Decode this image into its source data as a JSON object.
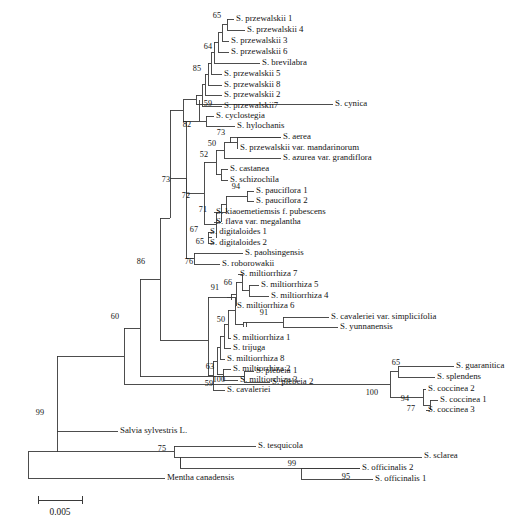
{
  "figure": {
    "scale_bar": {
      "label": "0.005",
      "x1": 38,
      "x2": 82,
      "y": 502
    }
  },
  "chart_data": {
    "type": "tree",
    "scale_label": "0.005",
    "tips": [
      {
        "id": "t1",
        "label": "S. przewalskii 1",
        "x": 236,
        "y": 19
      },
      {
        "id": "t2",
        "label": "S. przewalskii 4",
        "x": 247,
        "y": 30
      },
      {
        "id": "t3",
        "label": "S. przewalskii 3",
        "x": 231,
        "y": 41
      },
      {
        "id": "t4",
        "label": "S. przewalskii 6",
        "x": 231,
        "y": 52
      },
      {
        "id": "t5",
        "label": "S. brevilabra",
        "x": 262,
        "y": 63
      },
      {
        "id": "t6",
        "label": "S. przewalskii 5",
        "x": 224,
        "y": 74
      },
      {
        "id": "t7",
        "label": "S. przewalskii 8",
        "x": 224,
        "y": 85
      },
      {
        "id": "t8",
        "label": "S. przewalskii 2",
        "x": 224,
        "y": 95
      },
      {
        "id": "t9",
        "label": "S. przewalskii7",
        "x": 224,
        "y": 106
      },
      {
        "id": "t10",
        "label": "S. cynica",
        "x": 335,
        "y": 104
      },
      {
        "id": "t11",
        "label": "S. cyclostegia",
        "x": 216,
        "y": 116
      },
      {
        "id": "t12",
        "label": "S. hylochanis",
        "x": 237,
        "y": 126
      },
      {
        "id": "t13",
        "label": "S. aerea",
        "x": 283,
        "y": 137
      },
      {
        "id": "t14",
        "label": "S. przewalskii var. mandarinorum",
        "x": 240,
        "y": 148
      },
      {
        "id": "t15",
        "label": "S. azurea var. grandiflora",
        "x": 283,
        "y": 158
      },
      {
        "id": "t16",
        "label": "S. castanea",
        "x": 230,
        "y": 169
      },
      {
        "id": "t17",
        "label": "S. schizochila",
        "x": 230,
        "y": 180
      },
      {
        "id": "t18",
        "label": "S. pauciflora 1",
        "x": 256,
        "y": 191
      },
      {
        "id": "t19",
        "label": "S. pauciflora 2",
        "x": 256,
        "y": 201
      },
      {
        "id": "t20",
        "label": "S. kiaoemetiemsis f. pubescens",
        "x": 216,
        "y": 212
      },
      {
        "id": "t21",
        "label": "S. flava var. megalantha",
        "x": 216,
        "y": 222
      },
      {
        "id": "t22",
        "label": "S. digitaloides 1",
        "x": 210,
        "y": 232
      },
      {
        "id": "t23",
        "label": "S. digitaloides 2",
        "x": 210,
        "y": 243
      },
      {
        "id": "t24",
        "label": "S. paohsingensis",
        "x": 245,
        "y": 253
      },
      {
        "id": "t25",
        "label": "S. roborowakii",
        "x": 222,
        "y": 264
      },
      {
        "id": "t26",
        "label": "S. miltiorrhiza 7",
        "x": 240,
        "y": 274
      },
      {
        "id": "t27",
        "label": "S. miltiorrhiza 5",
        "x": 261,
        "y": 285
      },
      {
        "id": "t28",
        "label": "S. miltiorrhiza 4",
        "x": 271,
        "y": 296
      },
      {
        "id": "t29",
        "label": "S. miltiorrhiza 6",
        "x": 237,
        "y": 306
      },
      {
        "id": "t30",
        "label": "S. cavaleriei var. simplicifolia",
        "x": 331,
        "y": 317
      },
      {
        "id": "t31",
        "label": "S. yunnanensis",
        "x": 340,
        "y": 327
      },
      {
        "id": "t32",
        "label": "S. miltiorrhiza 1",
        "x": 233,
        "y": 338
      },
      {
        "id": "t33",
        "label": "S. trijuga",
        "x": 233,
        "y": 348
      },
      {
        "id": "t34",
        "label": "S. miltiorrhiza 8",
        "x": 227,
        "y": 359
      },
      {
        "id": "t35",
        "label": "S. miltiorrhiza 2",
        "x": 233,
        "y": 369
      },
      {
        "id": "t36",
        "label": "S. miltiorrhiza 3",
        "x": 240,
        "y": 380
      },
      {
        "id": "t37",
        "label": "S. cavaleriei",
        "x": 227,
        "y": 390
      },
      {
        "id": "t38",
        "label": "S. plebeia 1",
        "x": 256,
        "y": 371
      },
      {
        "id": "t39",
        "label": "S. plebeia 2",
        "x": 272,
        "y": 382
      },
      {
        "id": "t40",
        "label": "S. guaranitica",
        "x": 456,
        "y": 366
      },
      {
        "id": "t41",
        "label": "S. splendens",
        "x": 437,
        "y": 377
      },
      {
        "id": "t42",
        "label": "S. coccinea 2",
        "x": 428,
        "y": 389
      },
      {
        "id": "t43",
        "label": "S. coccinea 1",
        "x": 440,
        "y": 400
      },
      {
        "id": "t44",
        "label": "S. coccinea 3",
        "x": 428,
        "y": 410
      },
      {
        "id": "t45",
        "label": "Salvia sylvestris L.",
        "x": 120,
        "y": 431
      },
      {
        "id": "t46",
        "label": "S. tesquicola",
        "x": 258,
        "y": 446
      },
      {
        "id": "t47",
        "label": "S. sclarea",
        "x": 424,
        "y": 456
      },
      {
        "id": "t48",
        "label": "S. officinalis 2",
        "x": 362,
        "y": 468
      },
      {
        "id": "t49",
        "label": "S. officinalis 1",
        "x": 375,
        "y": 479
      },
      {
        "id": "t50",
        "label": "Mentha canadensis",
        "x": 167,
        "y": 478
      }
    ],
    "bootstrap_values": [
      {
        "value": "65",
        "x": 221,
        "y": 16
      },
      {
        "value": "64",
        "x": 212,
        "y": 47
      },
      {
        "value": "85",
        "x": 201,
        "y": 69
      },
      {
        "value": "59",
        "x": 212,
        "y": 104
      },
      {
        "value": "82",
        "x": 191,
        "y": 125
      },
      {
        "value": "73",
        "x": 225,
        "y": 133
      },
      {
        "value": "50",
        "x": 216,
        "y": 144
      },
      {
        "value": "52",
        "x": 208,
        "y": 155
      },
      {
        "value": "94",
        "x": 240,
        "y": 187
      },
      {
        "value": "72",
        "x": 190,
        "y": 196
      },
      {
        "value": "71",
        "x": 207,
        "y": 210
      },
      {
        "value": "67",
        "x": 198,
        "y": 230
      },
      {
        "value": "65",
        "x": 204,
        "y": 242
      },
      {
        "value": "73",
        "x": 170,
        "y": 180
      },
      {
        "value": "76",
        "x": 193,
        "y": 262
      },
      {
        "value": "91",
        "x": 219,
        "y": 288
      },
      {
        "value": "66",
        "x": 232,
        "y": 283
      },
      {
        "value": "91",
        "x": 268,
        "y": 313
      },
      {
        "value": "50",
        "x": 225,
        "y": 320
      },
      {
        "value": "63",
        "x": 214,
        "y": 367
      },
      {
        "value": "59",
        "x": 213,
        "y": 384
      },
      {
        "value": "86",
        "x": 145,
        "y": 262
      },
      {
        "value": "100",
        "x": 225,
        "y": 380
      },
      {
        "value": "60",
        "x": 119,
        "y": 317
      },
      {
        "value": "65",
        "x": 400,
        "y": 363
      },
      {
        "value": "100",
        "x": 378,
        "y": 393
      },
      {
        "value": "94",
        "x": 409,
        "y": 399
      },
      {
        "value": "77",
        "x": 415,
        "y": 409
      },
      {
        "value": "99",
        "x": 44,
        "y": 413
      },
      {
        "value": "75",
        "x": 166,
        "y": 449
      },
      {
        "value": "99",
        "x": 296,
        "y": 464
      },
      {
        "value": "95",
        "x": 350,
        "y": 477
      }
    ],
    "edges": "drawn as rectangular cladogram branches in the SVG template"
  }
}
